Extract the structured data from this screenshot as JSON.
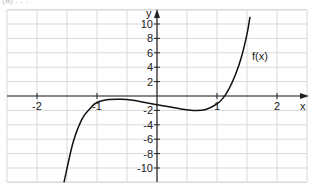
{
  "caption": "(a) . . .",
  "chart_data": {
    "type": "line",
    "title": "",
    "xlabel": "x",
    "ylabel": "y",
    "xlim": [
      -2.5,
      2.5
    ],
    "ylim": [
      -12,
      12
    ],
    "grid": true,
    "x_ticks": [
      -2,
      -1,
      1,
      2
    ],
    "x_tick_labels": [
      "-2",
      "-1",
      "1",
      "2"
    ],
    "y_ticks": [
      10,
      8,
      6,
      4,
      2,
      -2,
      -4,
      -6,
      -8,
      -10
    ],
    "y_tick_labels": [
      "10",
      "8",
      "6",
      "4",
      "2",
      "-2",
      "-4",
      "-6",
      "-8",
      "-10"
    ],
    "series": [
      {
        "name": "f(x)",
        "label": "f(x)",
        "x": [
          -1.55,
          -1.4,
          -1.25,
          -1.1,
          -1.0,
          -0.8,
          -0.6,
          -0.4,
          -0.2,
          0.0,
          0.2,
          0.4,
          0.6,
          0.8,
          1.0,
          1.1,
          1.2,
          1.3,
          1.4,
          1.5,
          1.55
        ],
        "y": [
          -12,
          -6.5,
          -3.2,
          -1.6,
          -0.9,
          -0.5,
          -0.45,
          -0.6,
          -0.9,
          -1.2,
          -1.5,
          -1.8,
          -2.0,
          -1.9,
          -1.1,
          -0.3,
          1.0,
          2.8,
          5.2,
          8.6,
          11
        ]
      }
    ],
    "annotations": [
      {
        "text": "f(x)",
        "x": 1.55,
        "y": 5.5
      }
    ]
  },
  "colors": {
    "grid": "#d9d9d9",
    "axis": "#222222",
    "curve": "#111111",
    "text": "#222222"
  }
}
